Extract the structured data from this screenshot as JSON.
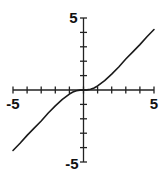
{
  "chart_data": {
    "type": "line",
    "title": "",
    "xlabel": "",
    "ylabel": "",
    "xlim": [
      -5,
      5
    ],
    "ylim": [
      -5,
      5
    ],
    "grid": false,
    "x_ticks": [
      -5,
      -4,
      -3,
      -2,
      -1,
      0,
      1,
      2,
      3,
      4,
      5
    ],
    "y_ticks": [
      -5,
      -4,
      -3,
      -2,
      -1,
      0,
      1,
      2,
      3,
      4,
      5
    ],
    "tick_labels": {
      "x_min": "-5",
      "x_max": "5",
      "y_max": "5",
      "y_min": "-5"
    },
    "series": [
      {
        "name": "curve",
        "color": "#1a1a1a",
        "x": [
          -5,
          -4.5,
          -4,
          -3.5,
          -3,
          -2.5,
          -2,
          -1.5,
          -1,
          -0.75,
          -0.5,
          -0.25,
          0,
          0.25,
          0.5,
          0.75,
          1,
          1.5,
          2,
          2.5,
          3,
          3.5,
          4,
          4.5,
          5
        ],
        "y": [
          -4.2,
          -3.7,
          -3.15,
          -2.65,
          -2.15,
          -1.6,
          -1.1,
          -0.65,
          -0.28,
          -0.14,
          -0.05,
          -0.01,
          0,
          0.01,
          0.05,
          0.14,
          0.28,
          0.65,
          1.1,
          1.6,
          2.15,
          2.65,
          3.15,
          3.7,
          4.2
        ]
      }
    ]
  }
}
